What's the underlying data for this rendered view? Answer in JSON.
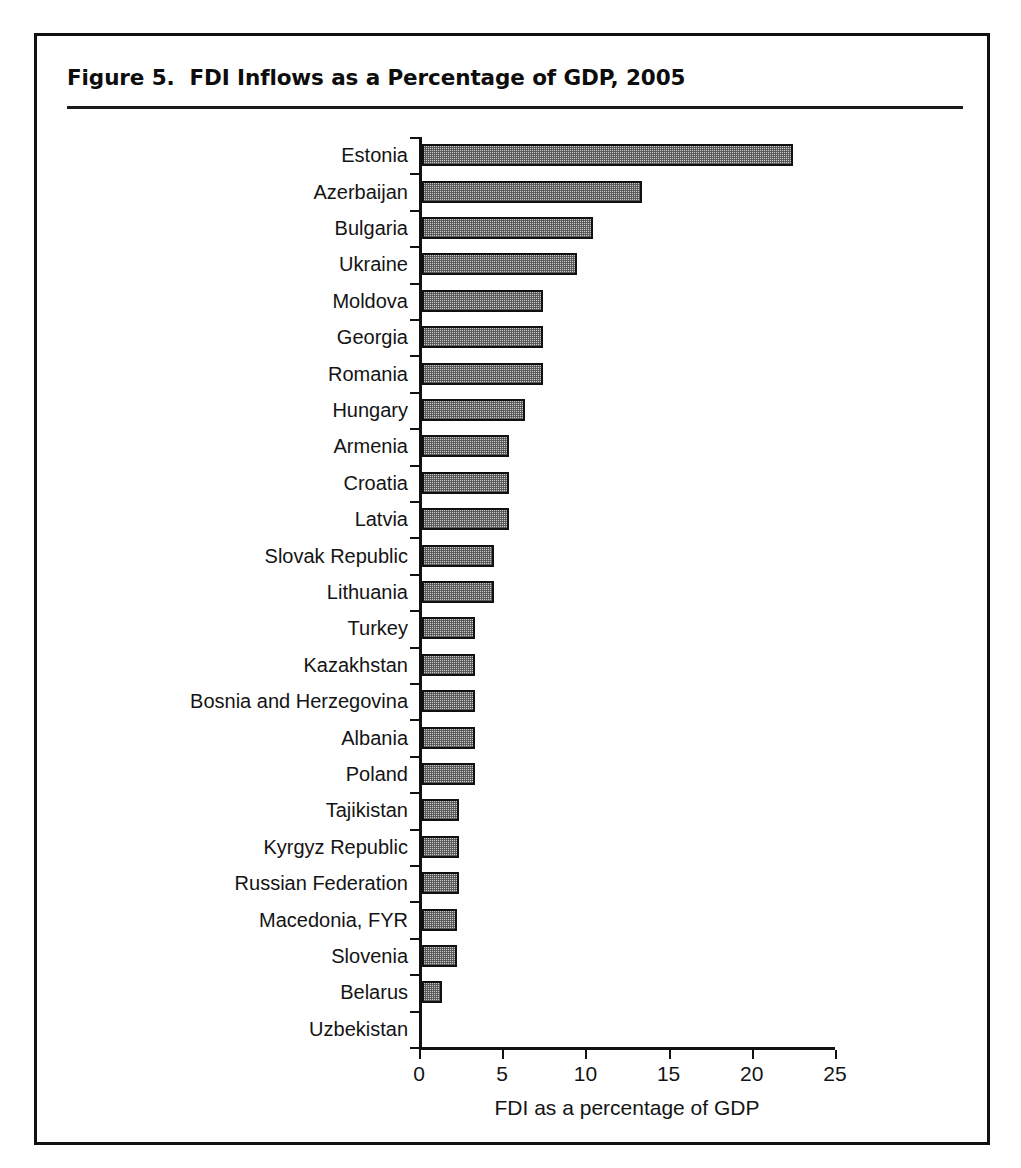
{
  "figure": {
    "title": "Figure 5.  FDI Inflows as a Percentage of GDP, 2005",
    "frame_color": "#111111",
    "bar_fill_color": "#c9c9c9",
    "bar_border_color": "#111111"
  },
  "chart_data": {
    "type": "bar",
    "orientation": "horizontal",
    "title": "Figure 5.  FDI Inflows as a Percentage of GDP, 2005",
    "xlabel": "FDI as a percentage of GDP",
    "ylabel": "",
    "xlim": [
      0,
      25
    ],
    "xticks": [
      0,
      5,
      10,
      15,
      20,
      25
    ],
    "xtick_labels": [
      "0",
      "5",
      "10",
      "15",
      "20",
      "25"
    ],
    "grid": false,
    "legend": null,
    "categories": [
      "Estonia",
      "Azerbaijan",
      "Bulgaria",
      "Ukraine",
      "Moldova",
      "Georgia",
      "Romania",
      "Hungary",
      "Armenia",
      "Croatia",
      "Latvia",
      "Slovak Republic",
      "Lithuania",
      "Turkey",
      "Kazakhstan",
      "Bosnia and Herzegovina",
      "Albania",
      "Poland",
      "Tajikistan",
      "Kyrgyz Republic",
      "Russian Federation",
      "Macedonia, FYR",
      "Slovenia",
      "Belarus",
      "Uzbekistan"
    ],
    "values": [
      22.3,
      13.2,
      10.3,
      9.3,
      7.3,
      7.3,
      7.3,
      6.2,
      5.2,
      5.2,
      5.2,
      4.3,
      4.3,
      3.2,
      3.2,
      3.2,
      3.2,
      3.2,
      2.2,
      2.2,
      2.2,
      2.1,
      2.1,
      1.2,
      0.0
    ]
  }
}
